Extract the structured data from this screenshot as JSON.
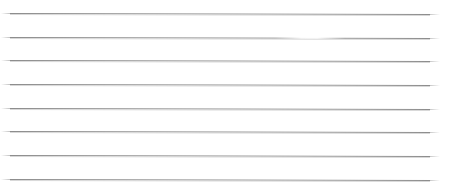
{
  "page": {
    "width": 449,
    "height": 192,
    "background_color": "#ffffff"
  },
  "style": {
    "line_color": "#8d8d8d",
    "line_shadow_color": "#d8d8d8",
    "line_thickness_px": 1,
    "line_count": 8,
    "line_spacing_px": 23.7,
    "line_start_x": 10,
    "line_end_x": 430
  },
  "lines": [
    {
      "id": "rule-1",
      "y": 13,
      "x_start": 10,
      "x_end": 430,
      "slope_px": 1,
      "has_break": false,
      "break_start": null,
      "break_width": null
    },
    {
      "id": "rule-2",
      "y": 37,
      "x_start": 10,
      "x_end": 430,
      "slope_px": 1,
      "has_break": true,
      "break_start": 275,
      "break_width": 70
    },
    {
      "id": "rule-3",
      "y": 60,
      "x_start": 10,
      "x_end": 430,
      "slope_px": 1,
      "has_break": false,
      "break_start": null,
      "break_width": null
    },
    {
      "id": "rule-4",
      "y": 84,
      "x_start": 10,
      "x_end": 430,
      "slope_px": 1,
      "has_break": false,
      "break_start": null,
      "break_width": null
    },
    {
      "id": "rule-5",
      "y": 108,
      "x_start": 10,
      "x_end": 430,
      "slope_px": 1,
      "has_break": false,
      "break_start": null,
      "break_width": null
    },
    {
      "id": "rule-6",
      "y": 131,
      "x_start": 10,
      "x_end": 430,
      "slope_px": 1,
      "has_break": false,
      "break_start": null,
      "break_width": null
    },
    {
      "id": "rule-7",
      "y": 155,
      "x_start": 10,
      "x_end": 430,
      "slope_px": 1,
      "has_break": false,
      "break_start": null,
      "break_width": null
    },
    {
      "id": "rule-8",
      "y": 179,
      "x_start": 10,
      "x_end": 430,
      "slope_px": 1,
      "has_break": false,
      "break_start": null,
      "break_width": null
    }
  ]
}
